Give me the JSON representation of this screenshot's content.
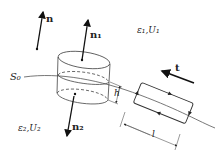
{
  "figure": {
    "labels": {
      "n": "n",
      "n1": "n₁",
      "n2": "n₂",
      "t": "t",
      "region1": "ε₁,U₁",
      "region2": "ε₂,U₂",
      "surface": "S₀",
      "height": "h",
      "length": "l"
    }
  }
}
